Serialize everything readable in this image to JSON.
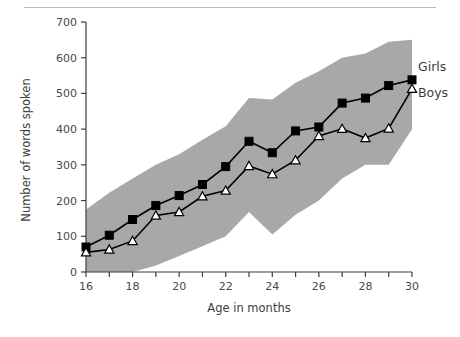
{
  "chart_data": {
    "type": "line",
    "title": "",
    "xlabel": "Age in months",
    "ylabel": "Number of words spoken",
    "xlim": [
      16,
      30
    ],
    "ylim": [
      0,
      700
    ],
    "xticks": [
      16,
      17,
      18,
      19,
      20,
      21,
      22,
      23,
      24,
      25,
      26,
      27,
      28,
      29,
      30
    ],
    "xticklabels": [
      "16",
      "",
      "18",
      "",
      "20",
      "",
      "22",
      "",
      "24",
      "",
      "26",
      "",
      "28",
      "",
      "30"
    ],
    "yticks": [
      0,
      100,
      200,
      300,
      400,
      500,
      600,
      700
    ],
    "yticklabels": [
      "0",
      "100",
      "200",
      "300",
      "400",
      "500",
      "600",
      "700"
    ],
    "grid": false,
    "legend_position": "right-inline",
    "x": [
      16,
      17,
      18,
      19,
      20,
      21,
      22,
      23,
      24,
      25,
      26,
      27,
      28,
      29,
      30
    ],
    "series": [
      {
        "name": "Girls",
        "marker": "filled-square",
        "color": "#000000",
        "values": [
          70,
          103,
          147,
          186,
          214,
          245,
          295,
          366,
          334,
          395,
          406,
          473,
          487,
          522,
          538
        ]
      },
      {
        "name": "Boys",
        "marker": "open-triangle",
        "color": "#000000",
        "values": [
          55,
          63,
          87,
          158,
          168,
          212,
          228,
          297,
          274,
          313,
          381,
          401,
          375,
          402,
          513
        ]
      }
    ],
    "band": {
      "name": "range-band",
      "color": "#a8a8a8",
      "upper": [
        175,
        222,
        262,
        300,
        330,
        370,
        408,
        487,
        483,
        530,
        562,
        600,
        612,
        645,
        650
      ],
      "lower": [
        0,
        0,
        0,
        18,
        45,
        72,
        100,
        168,
        105,
        160,
        200,
        262,
        300,
        300,
        400
      ]
    },
    "annotations": [
      {
        "text": "Girls",
        "x": 30,
        "y": 580
      },
      {
        "text": "Boys",
        "x": 30,
        "y": 495
      }
    ]
  }
}
